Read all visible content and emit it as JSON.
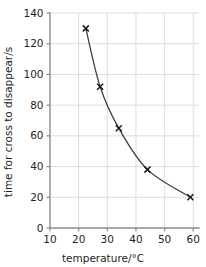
{
  "chart_data": {
    "type": "line",
    "title": "",
    "subtitle": "",
    "xlabel": "temperature/°C",
    "ylabel": "time for cross to disappear/s",
    "xlim": [
      10,
      62
    ],
    "ylim": [
      0,
      140
    ],
    "xticks": [
      10,
      20,
      30,
      40,
      50,
      60
    ],
    "yticks": [
      0,
      20,
      40,
      60,
      80,
      100,
      120,
      140
    ],
    "xtick_labels": [
      "10",
      "20",
      "30",
      "40",
      "50",
      "60"
    ],
    "ytick_labels": [
      "0",
      "20",
      "40",
      "60",
      "80",
      "100",
      "120",
      "140"
    ],
    "grid": true,
    "legend": false,
    "legend_position": "none",
    "marker": "x-cross",
    "series": [
      {
        "name": "time for cross to disappear",
        "x": [
          22.5,
          27.5,
          34.0,
          44.0,
          59.0
        ],
        "y": [
          130,
          92,
          65,
          38,
          20
        ]
      }
    ],
    "annotations": []
  },
  "axes": {
    "x_title": "temperature/°C",
    "y_title": "time for cross to disappear/s"
  },
  "colors": {
    "curve": "#3a3a3c",
    "marker": "#1a1a1a",
    "grid": "#d4d4d6",
    "axis": "#8b8b8e",
    "text": "#231f20",
    "background": "#ffffff"
  }
}
